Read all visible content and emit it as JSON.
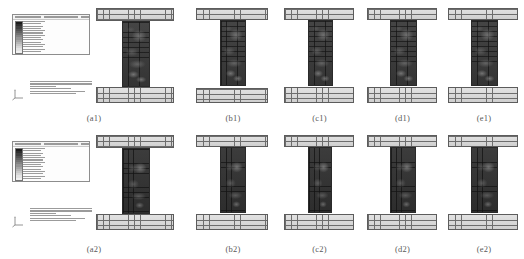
{
  "figure": {
    "type": "fea-contour-grid",
    "rows": 2,
    "columns": 5,
    "background_color": "#ffffff",
    "caption_color": "#595959",
    "software_viewport": "contour plot viewport"
  },
  "legend": {
    "title_placeholder": "",
    "colormap": "grayscale",
    "swatch_count": 14,
    "colors": [
      "#1b1b1b",
      "#2e2e2e",
      "#3f3f3f",
      "#505050",
      "#616161",
      "#727272",
      "#838383",
      "#949494",
      "#a5a5a5",
      "#b6b6b6",
      "#c7c7c7",
      "#d6d6d6",
      "#e4e4e4",
      "#f0f0f0"
    ]
  },
  "triad": {
    "axis_1_label": "1",
    "axis_2_label": "2",
    "axis_3_label": "3"
  },
  "panels": [
    {
      "id": "a1",
      "caption": "(a1)",
      "has_legend": true,
      "has_triad": true,
      "has_status": true,
      "web_variant": "v1",
      "flange_top_width": 78,
      "flange_bot_width": 78,
      "web_width": 28,
      "web_height": 66
    },
    {
      "id": "b1",
      "caption": "(b1)",
      "has_legend": false,
      "has_triad": false,
      "has_status": false,
      "web_variant": "v1",
      "flange_top_width": 72,
      "flange_bot_width": 72,
      "web_width": 26,
      "web_height": 66
    },
    {
      "id": "c1",
      "caption": "(c1)",
      "has_legend": false,
      "has_triad": false,
      "has_status": false,
      "web_variant": "v1",
      "flange_top_width": 70,
      "flange_bot_width": 70,
      "web_width": 25,
      "web_height": 66
    },
    {
      "id": "d1",
      "caption": "(d1)",
      "has_legend": false,
      "has_triad": false,
      "has_status": false,
      "web_variant": "v1",
      "flange_top_width": 70,
      "flange_bot_width": 70,
      "web_width": 27,
      "web_height": 66
    },
    {
      "id": "e1",
      "caption": "(e1)",
      "has_legend": false,
      "has_triad": false,
      "has_status": false,
      "web_variant": "v1",
      "flange_top_width": 70,
      "flange_bot_width": 70,
      "web_width": 27,
      "web_height": 66
    },
    {
      "id": "a2",
      "caption": "(a2)",
      "has_legend": true,
      "has_triad": true,
      "has_status": true,
      "web_variant": "v2",
      "flange_top_width": 78,
      "flange_bot_width": 78,
      "web_width": 28,
      "web_height": 66
    },
    {
      "id": "b2",
      "caption": "(b2)",
      "has_legend": false,
      "has_triad": false,
      "has_status": false,
      "web_variant": "v2",
      "flange_top_width": 72,
      "flange_bot_width": 72,
      "web_width": 26,
      "web_height": 66
    },
    {
      "id": "c2",
      "caption": "(c2)",
      "has_legend": false,
      "has_triad": false,
      "has_status": false,
      "web_variant": "v2",
      "flange_top_width": 70,
      "flange_bot_width": 70,
      "web_width": 24,
      "web_height": 66
    },
    {
      "id": "d2",
      "caption": "(d2)",
      "has_legend": false,
      "has_triad": false,
      "has_status": false,
      "web_variant": "v2",
      "flange_top_width": 70,
      "flange_bot_width": 70,
      "web_width": 26,
      "web_height": 66
    },
    {
      "id": "e2",
      "caption": "(e2)",
      "has_legend": false,
      "has_triad": false,
      "has_status": false,
      "web_variant": "v2",
      "flange_top_width": 70,
      "flange_bot_width": 70,
      "web_width": 27,
      "web_height": 66
    }
  ]
}
